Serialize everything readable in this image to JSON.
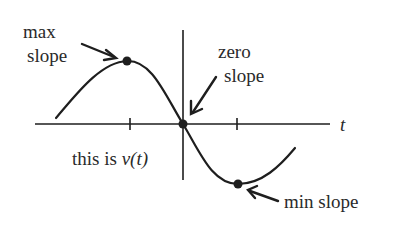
{
  "diagram": {
    "function_label_prefix": "this is ",
    "function_label_symbol": "v(t)",
    "axis_label_t": "t",
    "annotations": {
      "max": {
        "line1": "max",
        "line2": "slope"
      },
      "zero": {
        "line1": "zero",
        "line2": "slope"
      },
      "min": {
        "line1": "min slope"
      }
    },
    "points": [
      {
        "name": "max-slope-point",
        "x": 127,
        "y": 61
      },
      {
        "name": "zero-slope-point",
        "x": 183,
        "y": 124
      },
      {
        "name": "min-slope-point",
        "x": 238,
        "y": 184
      }
    ],
    "colors": {
      "ink": "#1e1e1e",
      "text": "#2a2a2a",
      "background": "#ffffff"
    }
  }
}
